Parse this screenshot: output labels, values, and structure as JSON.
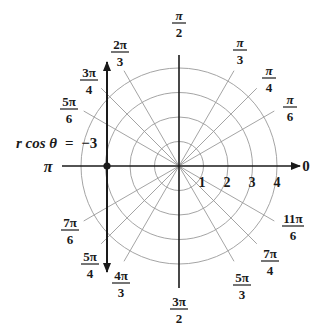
{
  "diagram": {
    "type": "polar-coordinate-grid",
    "center": {
      "x": 179,
      "y": 166
    },
    "unit_px": 24.5,
    "circle_radii": [
      1,
      2,
      3,
      4
    ],
    "radial_labels": [
      "1",
      "2",
      "3",
      "4"
    ],
    "angle_labels": [
      {
        "num": "",
        "den": "",
        "text": "0",
        "deg": 0
      },
      {
        "num": "π",
        "den": "6",
        "deg": 30
      },
      {
        "num": "π",
        "den": "4",
        "deg": 45
      },
      {
        "num": "π",
        "den": "3",
        "deg": 60
      },
      {
        "num": "π",
        "den": "2",
        "deg": 90
      },
      {
        "num": "2π",
        "den": "3",
        "deg": 120
      },
      {
        "num": "3π",
        "den": "4",
        "deg": 135
      },
      {
        "num": "5π",
        "den": "6",
        "deg": 150
      },
      {
        "num": "",
        "den": "",
        "text": "π",
        "deg": 180
      },
      {
        "num": "7π",
        "den": "6",
        "deg": 210
      },
      {
        "num": "5π",
        "den": "4",
        "deg": 225
      },
      {
        "num": "4π",
        "den": "3",
        "deg": 240
      },
      {
        "num": "3π",
        "den": "2",
        "deg": 270
      },
      {
        "num": "5π",
        "den": "3",
        "deg": 300
      },
      {
        "num": "7π",
        "den": "4",
        "deg": 315
      },
      {
        "num": "11π",
        "den": "6",
        "deg": 330
      }
    ],
    "line": {
      "equation_lhs": "r cos θ",
      "equation_eq": "=",
      "equation_rhs": "−3",
      "x_value": -3,
      "point_label": "(3, π)"
    },
    "colors": {
      "axis": "#1a1a1a",
      "grid": "#9a9a9a",
      "line": "#1a1a1a",
      "text": "#1a1a1a"
    }
  }
}
